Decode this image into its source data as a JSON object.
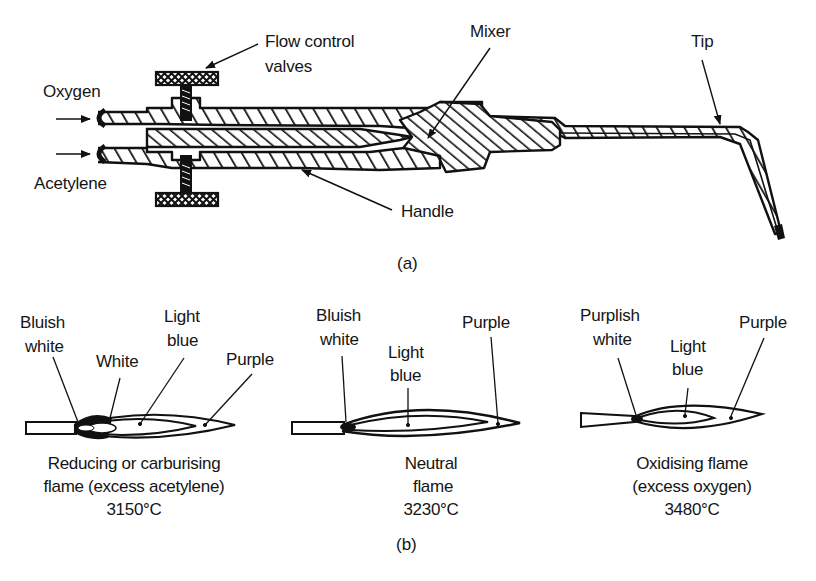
{
  "figure_a": {
    "caption": "(a)",
    "labels": {
      "oxygen": "Oxygen",
      "acetylene": "Acetylene",
      "flow_control_line1": "Flow control",
      "flow_control_line2": "valves",
      "mixer": "Mixer",
      "tip": "Tip",
      "handle": "Handle"
    }
  },
  "figure_b": {
    "caption": "(b)",
    "flames": [
      {
        "name": "reducing",
        "labels": {
          "bluish_line1": "Bluish",
          "bluish_line2": "white",
          "white": "White",
          "light_line1": "Light",
          "light_line2": "blue",
          "purple": "Purple"
        },
        "title_line1": "Reducing or carburising",
        "title_line2": "flame (excess acetylene)",
        "temperature": "3150°C"
      },
      {
        "name": "neutral",
        "labels": {
          "bluish_line1": "Bluish",
          "bluish_line2": "white",
          "light_line1": "Light",
          "light_line2": "blue",
          "purple": "Purple"
        },
        "title_line1": "Neutral",
        "title_line2": "flame",
        "temperature": "3230°C"
      },
      {
        "name": "oxidising",
        "labels": {
          "purplish_line1": "Purplish",
          "purplish_line2": "white",
          "light_line1": "Light",
          "light_line2": "blue",
          "purple": "Purple"
        },
        "title_line1": "Oxidising flame",
        "title_line2": "(excess oxygen)",
        "temperature": "3480°C"
      }
    ]
  }
}
